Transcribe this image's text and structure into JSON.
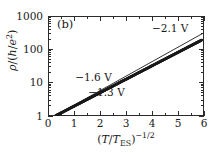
{
  "figure": {
    "panel_label": "(b)",
    "background_color": "#ffffff",
    "foreground_color": "#1a1a1a"
  },
  "chart_data": {
    "type": "scatter",
    "title": "",
    "subtitle": "",
    "panel": "(b)",
    "xlabel": "(T/T_ES)^-1/2",
    "ylabel": "rho/(h/e^2)",
    "xlabel_parts": {
      "open": "(",
      "numerator": "T",
      "slash": "/",
      "denominator": "T",
      "denominator_sub": "ES",
      "close": ")",
      "exponent": "−1/2"
    },
    "ylabel_parts": {
      "symbol": "ρ",
      "slash": "/",
      "open": "(",
      "h": "h",
      "inner_slash": "/",
      "e": "e",
      "exponent": "2",
      "close": ")"
    },
    "xscale": "linear",
    "yscale": "log",
    "xlim": [
      0,
      6
    ],
    "ylim": [
      1,
      1000
    ],
    "grid": false,
    "legend": false,
    "legend_position": "none",
    "xticks": [
      0,
      1,
      2,
      3,
      4,
      5,
      6
    ],
    "xticklabels": [
      "0",
      "1",
      "2",
      "3",
      "4",
      "5",
      "6"
    ],
    "xminorticks": [
      0.5,
      1.5,
      2.5,
      3.5,
      4.5,
      5.5
    ],
    "yticks": [
      1,
      10,
      100,
      1000
    ],
    "yticklabels": [
      "1",
      "10",
      "100",
      "1000"
    ],
    "yminorticks": [
      2,
      3,
      4,
      5,
      6,
      7,
      8,
      9,
      20,
      30,
      40,
      50,
      60,
      70,
      80,
      90,
      200,
      300,
      400,
      500,
      600,
      700,
      800,
      900
    ],
    "marker": "dot",
    "marker_size": 1.4,
    "color": "#1a1a1a",
    "series": [
      {
        "name": "rho vs (T/T_ES)^-1/2",
        "x": [
          0.3,
          0.4,
          0.5,
          0.6,
          0.7,
          0.8,
          0.9,
          1.0,
          1.1,
          1.2,
          1.3,
          1.4,
          1.5,
          1.6,
          1.7,
          1.8,
          1.9,
          2.0,
          2.1,
          2.2,
          2.3,
          2.4,
          2.5,
          2.6,
          2.7,
          2.8,
          2.9,
          3.0,
          3.1,
          3.2,
          3.3,
          3.4,
          3.5,
          3.6,
          3.7,
          3.8,
          3.9,
          4.0,
          4.1,
          4.2,
          4.3,
          4.4,
          4.5,
          4.6,
          4.7,
          4.8,
          4.9,
          5.0,
          5.1,
          5.2,
          5.3,
          5.4,
          5.5,
          5.6,
          5.7,
          5.8,
          5.9
        ],
        "y": [
          1.03,
          1.12,
          1.23,
          1.35,
          1.48,
          1.63,
          1.79,
          1.96,
          2.15,
          2.36,
          2.59,
          2.84,
          3.12,
          3.42,
          3.76,
          4.12,
          4.53,
          4.97,
          5.45,
          5.98,
          6.57,
          7.21,
          7.91,
          8.68,
          9.53,
          10.5,
          11.5,
          12.6,
          13.8,
          15.2,
          16.6,
          18.3,
          20.1,
          22.0,
          24.2,
          26.5,
          29.1,
          32.0,
          35.1,
          38.5,
          42.3,
          46.4,
          50.9,
          55.9,
          61.3,
          67.3,
          73.8,
          81.0,
          88.9,
          97.6,
          107.0,
          117.5,
          129.0,
          141.5,
          155.3,
          170.4,
          187.0
        ]
      }
    ],
    "fit_line": {
      "name": "guide line",
      "x": [
        0.25,
        5.95
      ],
      "y": [
        1.0,
        300.0
      ]
    },
    "annotations": [
      {
        "text": "−2.1 V",
        "x": 4.0,
        "y": 430
      },
      {
        "text": "−1.6 V",
        "x": 1.05,
        "y": 14.5
      },
      {
        "text": "−1.3 V",
        "x": 1.55,
        "y": 5.2
      }
    ]
  }
}
